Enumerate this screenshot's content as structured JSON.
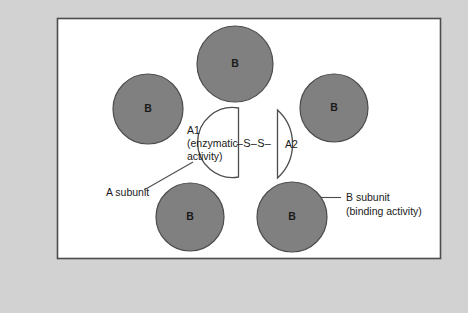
{
  "figure": {
    "background_color": "#d2d2d2",
    "panel_color": "#ffffff",
    "panel_border_color": "#4c4c4c",
    "subunit_fill_color": "#808080",
    "subunit_stroke_color": "#4c4c4c",
    "text_color": "#1a1a1a"
  },
  "b_subunits": [
    {
      "id": "b-top",
      "label": "B",
      "cx": 235,
      "cy": 64,
      "r": 38
    },
    {
      "id": "b-left",
      "label": "B",
      "cx": 148,
      "cy": 109,
      "r": 35
    },
    {
      "id": "b-right",
      "label": "B",
      "cx": 334,
      "cy": 108,
      "r": 34
    },
    {
      "id": "b-bottom-left",
      "label": "B",
      "cx": 190,
      "cy": 217,
      "r": 34
    },
    {
      "id": "b-bottom-right",
      "label": "B",
      "cx": 292,
      "cy": 217,
      "r": 35
    }
  ],
  "a_subunit": {
    "a1": {
      "id": "a1-domain",
      "lines": [
        "A1",
        "(enzymatic",
        "activity)"
      ],
      "line1": "A1",
      "line2": "(enzymatic",
      "line3": "activity)"
    },
    "a2": {
      "id": "a2-domain",
      "label": "A2"
    },
    "disulfide_bond": {
      "id": "disulfide-bond",
      "label": "–S–S–"
    }
  },
  "callouts": [
    {
      "id": "a-subunit-callout",
      "lines": [
        "A subunit"
      ],
      "line1": "A subunit",
      "line2": ""
    },
    {
      "id": "b-subunit-callout",
      "lines": [
        "B subunit",
        "(binding activity)"
      ],
      "line1": "B subunit",
      "line2": "(binding activity)"
    }
  ]
}
